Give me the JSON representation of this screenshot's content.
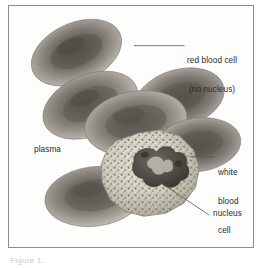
{
  "figure": {
    "frame": {
      "border_color": "#8d8d8d",
      "background": "#fefefe"
    },
    "caption": "Figure 1.",
    "labels": [
      {
        "id": "red-blood-cell",
        "line1": "red blood cell",
        "line2": "(no nucleus)",
        "x": 186,
        "y": 38
      },
      {
        "id": "plasma",
        "line1": "plasma",
        "line2": "",
        "x": 33,
        "y": 148
      },
      {
        "id": "white-blood-cell",
        "line1": "white",
        "line2": "blood",
        "line3": "cell",
        "x": 217,
        "y": 151
      },
      {
        "id": "nucleus",
        "line1": "nucleus",
        "line2": "",
        "x": 212,
        "y": 212
      }
    ],
    "leader_lines": [
      {
        "id": "leader-red-blood-cell",
        "x1": 126,
        "y1": 45,
        "x2": 185,
        "y2": 45
      },
      {
        "id": "leader-white-blood-cell",
        "x1": 190,
        "y1": 157,
        "x2": 215,
        "y2": 157
      },
      {
        "id": "leader-nucleus",
        "x1": 152,
        "y1": 180,
        "x2": 210,
        "y2": 215
      }
    ],
    "cells": {
      "red_blood_cell_count": 6,
      "white_blood_cell_count": 1,
      "red_blood_cell_shape": "biconcave disc",
      "white_blood_cell_shape": "granular amoeboid",
      "nucleus_shape": "multi-lobed",
      "colors": {
        "rbc_rim": "#b9b5ae",
        "rbc_body": "#7d7a74",
        "rbc_center": "#57544f",
        "wbc_cytoplasm": "#d9d5c8",
        "wbc_granules": "#6e6a60",
        "nucleus": "#4a4641",
        "plasma_background": "#fbfbfa"
      }
    }
  }
}
